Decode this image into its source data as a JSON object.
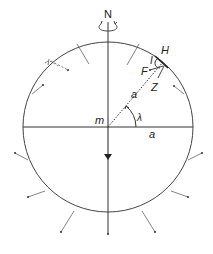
{
  "diagram": {
    "labels": {
      "north": "N",
      "center": "m",
      "horizon": "H",
      "inclination": "I",
      "field": "F",
      "zenith": "Z",
      "radius_slanted": "a",
      "radius_horizontal": "a",
      "latitude": "λ"
    },
    "colors": {
      "stroke": "#333333",
      "light_stroke": "#888888",
      "background": "#ffffff"
    },
    "geometry": {
      "center": [
        108,
        127
      ],
      "radius": 85,
      "latitude_deg": 50
    }
  }
}
